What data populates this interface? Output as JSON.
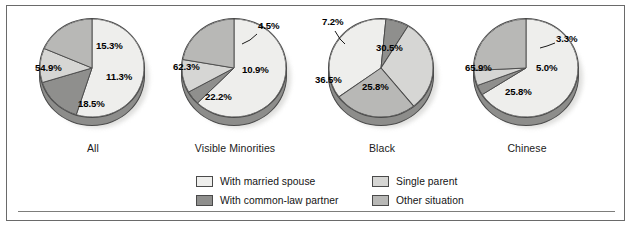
{
  "figure": {
    "background": "#ffffff",
    "frame_color": "#6a6a6a"
  },
  "legend": {
    "position": "bottom-center",
    "entries": [
      {
        "label": "With married spouse",
        "color": "#eeeeec",
        "key": "married_spouse"
      },
      {
        "label": "Single parent",
        "color": "#d6d6d4",
        "key": "single_parent"
      },
      {
        "label": "With common-law partner",
        "color": "#8f8f8d",
        "key": "common_law"
      },
      {
        "label": "Other situation",
        "color": "#b8b8b6",
        "key": "other_situation"
      }
    ]
  },
  "chart_data": {
    "type": "pie",
    "title": "",
    "subtitle": "",
    "xlabel": "",
    "ylabel": "",
    "grid": false,
    "units": "percent",
    "legend_position": "bottom",
    "categories": [
      "With married spouse",
      "With common-law partner",
      "Single parent",
      "Other situation"
    ],
    "colors": [
      "#eeeeec",
      "#8f8f8d",
      "#d6d6d4",
      "#b8b8b6"
    ],
    "charts": [
      {
        "name": "All",
        "label": "All",
        "start_angle": 0,
        "values": [
          54.9,
          15.3,
          11.3,
          18.5
        ],
        "value_labels": [
          "54.9%",
          "15.3%",
          "11.3%",
          "18.5%"
        ]
      },
      {
        "name": "Visible Minorities",
        "label": "Visible Minorities",
        "start_angle": 0,
        "values": [
          62.3,
          4.5,
          10.9,
          22.2
        ],
        "value_labels": [
          "62.3%",
          "4.5%",
          "10.9%",
          "22.2%"
        ]
      },
      {
        "name": "Black",
        "label": "Black",
        "start_angle": 297,
        "values": [
          36.5,
          7.2,
          30.5,
          25.8
        ],
        "value_labels": [
          "36.5%",
          "7.2%",
          "30.5%",
          "25.8%"
        ]
      },
      {
        "name": "Chinese",
        "label": "Chinese",
        "start_angle": 0,
        "values": [
          65.9,
          3.3,
          5.0,
          25.8
        ],
        "value_labels": [
          "65.9%",
          "3.3%",
          "5.0%",
          "25.8%"
        ]
      }
    ]
  },
  "pies": {
    "all": {
      "caption": "All",
      "labels": {
        "married": "54.9%",
        "common_law": "15.3%",
        "single": "11.3%",
        "other": "18.5%"
      }
    },
    "visible_minorities": {
      "caption": "Visible Minorities",
      "labels": {
        "married": "62.3%",
        "common_law": "4.5%",
        "single": "10.9%",
        "other": "22.2%"
      }
    },
    "black": {
      "caption": "Black",
      "labels": {
        "married": "36.5%",
        "common_law": "7.2%",
        "single": "30.5%",
        "other": "25.8%"
      }
    },
    "chinese": {
      "caption": "Chinese",
      "labels": {
        "married": "65.9%",
        "common_law": "3.3%",
        "single": "5.0%",
        "other": "25.8%"
      }
    }
  }
}
